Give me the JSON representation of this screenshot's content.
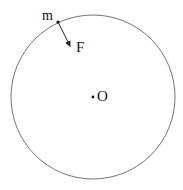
{
  "diagram": {
    "labels": {
      "mass": "m",
      "force": "F",
      "center": "O"
    },
    "colors": {
      "stroke": "#555555",
      "text": "#111111"
    }
  }
}
